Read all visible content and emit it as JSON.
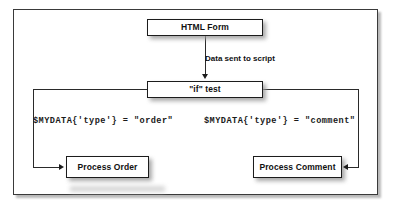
{
  "figure": {
    "type": "flowchart",
    "title_visible": false,
    "frame": {
      "border_color": "#3a3a3a",
      "background": "#ffffff"
    },
    "nodes": [
      {
        "id": "html-form",
        "label": "HTML Form",
        "shape": "rectangle"
      },
      {
        "id": "if-test",
        "label": "\"if\" test",
        "shape": "rectangle"
      },
      {
        "id": "process-order",
        "label": "Process Order",
        "shape": "rectangle"
      },
      {
        "id": "process-comment",
        "label": "Process Comment",
        "shape": "rectangle"
      }
    ],
    "edges": [
      {
        "id": "form-to-if",
        "from": "html-form",
        "to": "if-test",
        "label": "Data sent to script",
        "arrow": "down"
      },
      {
        "id": "if-to-order",
        "from": "if-test",
        "to": "process-order",
        "label": "$MYDATA{'type'} = \"order\"",
        "arrow": "right"
      },
      {
        "id": "if-to-comment",
        "from": "if-test",
        "to": "process-comment",
        "label": "$MYDATA{'type'} = \"comment\"",
        "arrow": "left"
      }
    ],
    "colors": {
      "line": "#2a2a2a",
      "box_border": "#1c1c1c",
      "text": "#111111",
      "shadow": "#9a9a9a"
    }
  }
}
